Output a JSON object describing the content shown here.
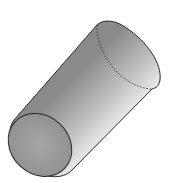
{
  "figure": {
    "colors": {
      "background": "#ffffff",
      "outline": "#2a2a2a",
      "face": "#9a9a9a",
      "body_dark": "#8a8a8a",
      "body_light": "#ececec"
    }
  }
}
